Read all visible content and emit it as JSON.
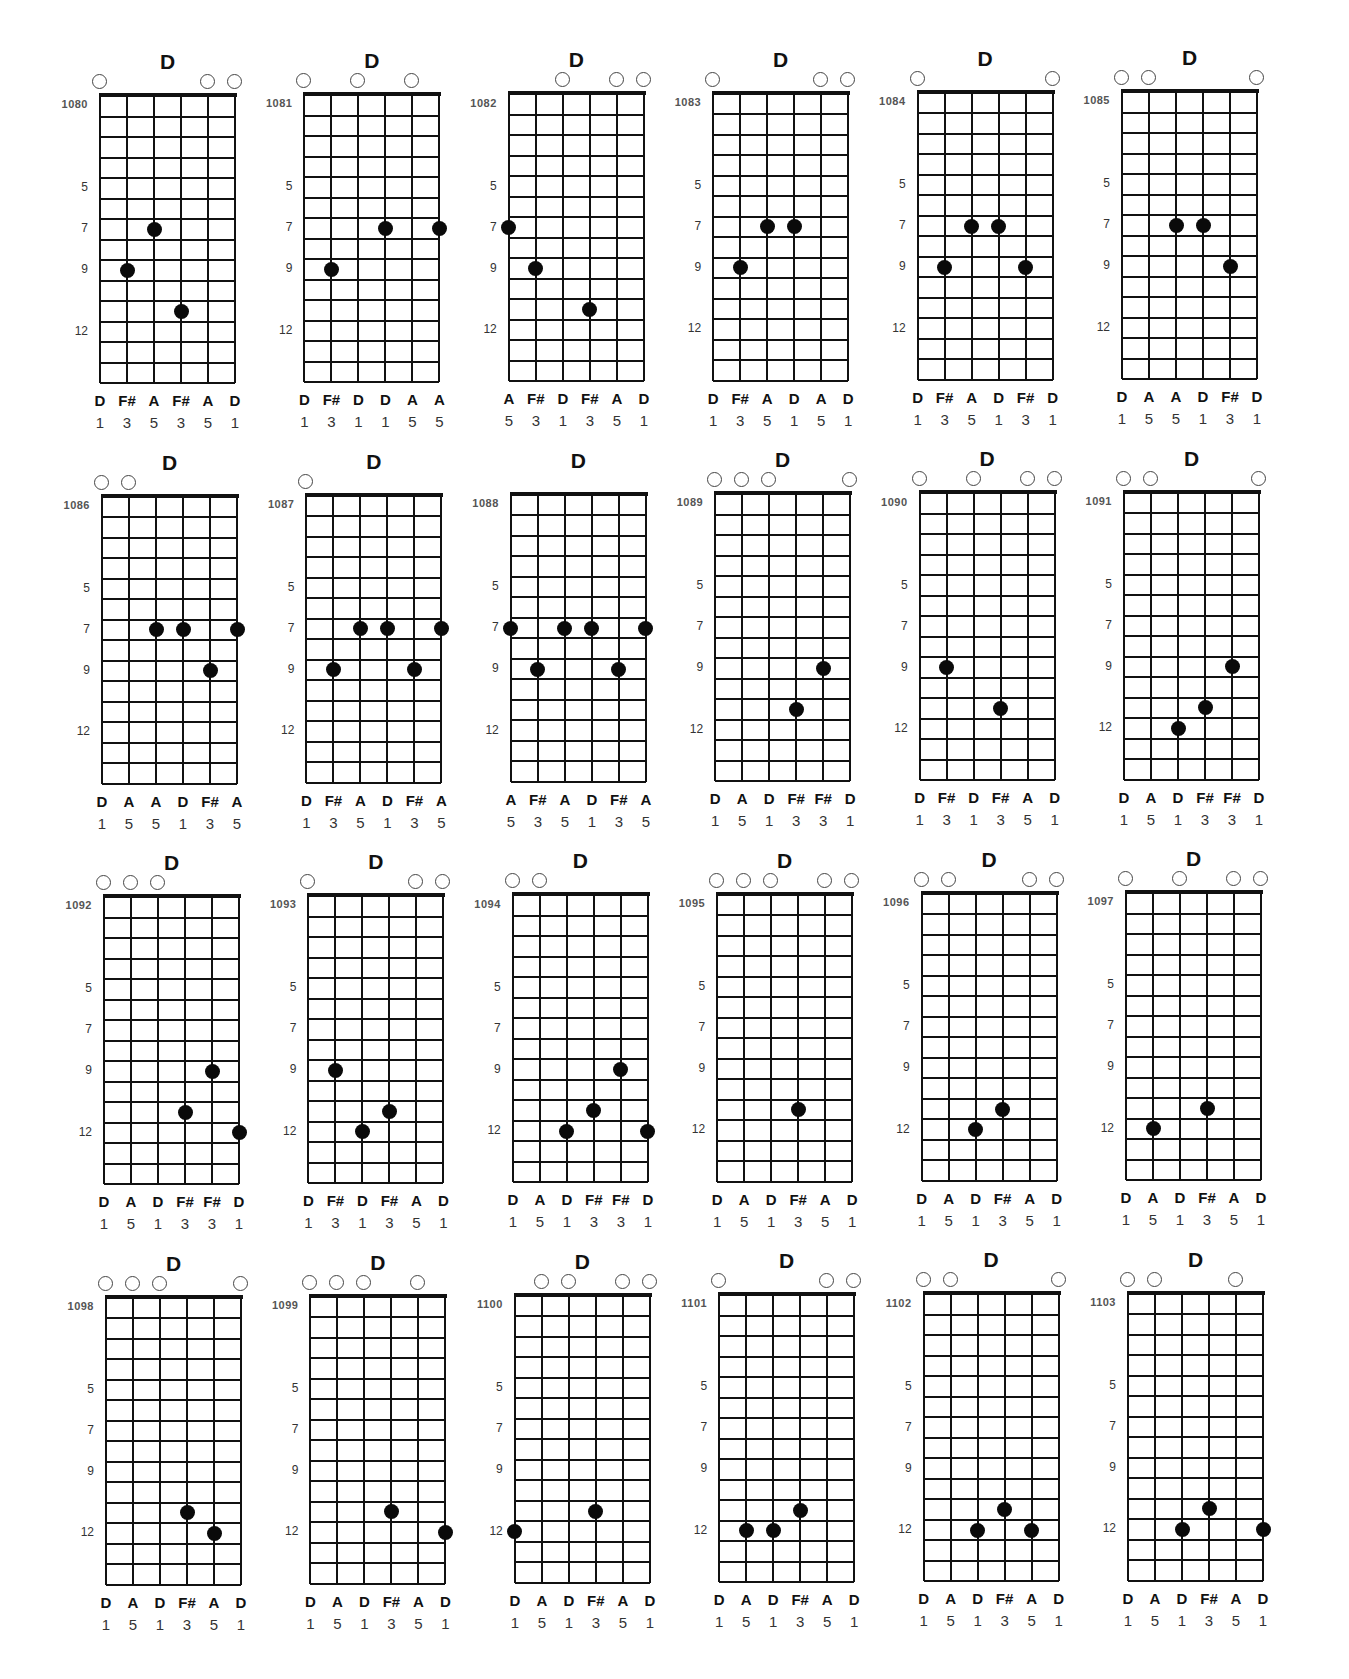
{
  "page": {
    "strings": 6,
    "frets_shown": 14,
    "fret_markers": [
      5,
      7,
      9,
      12
    ],
    "colors": {
      "ink": "#111111",
      "dot": "#0a0a0a",
      "background": "#ffffff"
    }
  },
  "charts": [
    {
      "id": "1080",
      "title": "D",
      "open": [
        0,
        4,
        5
      ],
      "dots": [
        [
          1,
          9
        ],
        [
          2,
          7
        ],
        [
          3,
          11
        ]
      ],
      "notes": [
        "D",
        "F#",
        "A",
        "F#",
        "A",
        "D"
      ],
      "fingers": [
        "1",
        "3",
        "5",
        "3",
        "5",
        "1"
      ]
    },
    {
      "id": "1081",
      "title": "D",
      "open": [
        0,
        2,
        4
      ],
      "dots": [
        [
          1,
          9
        ],
        [
          3,
          7
        ],
        [
          5,
          7
        ]
      ],
      "notes": [
        "D",
        "F#",
        "D",
        "D",
        "A",
        "A"
      ],
      "fingers": [
        "1",
        "3",
        "1",
        "1",
        "5",
        "5"
      ]
    },
    {
      "id": "1082",
      "title": "D",
      "open": [
        2,
        4,
        5
      ],
      "dots": [
        [
          0,
          7
        ],
        [
          1,
          9
        ],
        [
          3,
          11
        ]
      ],
      "notes": [
        "A",
        "F#",
        "D",
        "F#",
        "A",
        "D"
      ],
      "fingers": [
        "5",
        "3",
        "1",
        "3",
        "5",
        "1"
      ]
    },
    {
      "id": "1083",
      "title": "D",
      "open": [
        0,
        4,
        5
      ],
      "dots": [
        [
          1,
          9
        ],
        [
          2,
          7
        ],
        [
          3,
          7
        ]
      ],
      "notes": [
        "D",
        "F#",
        "A",
        "D",
        "A",
        "D"
      ],
      "fingers": [
        "1",
        "3",
        "5",
        "1",
        "5",
        "1"
      ]
    },
    {
      "id": "1084",
      "title": "D",
      "open": [
        0,
        5
      ],
      "dots": [
        [
          1,
          9
        ],
        [
          2,
          7
        ],
        [
          3,
          7
        ],
        [
          4,
          9
        ]
      ],
      "notes": [
        "D",
        "F#",
        "A",
        "D",
        "F#",
        "D"
      ],
      "fingers": [
        "1",
        "3",
        "5",
        "1",
        "3",
        "1"
      ]
    },
    {
      "id": "1085",
      "title": "D",
      "open": [
        0,
        1,
        5
      ],
      "dots": [
        [
          2,
          7
        ],
        [
          3,
          7
        ],
        [
          4,
          9
        ]
      ],
      "notes": [
        "D",
        "A",
        "A",
        "D",
        "F#",
        "D"
      ],
      "fingers": [
        "1",
        "5",
        "5",
        "1",
        "3",
        "1"
      ]
    },
    {
      "id": "1086",
      "title": "D",
      "open": [
        0,
        1
      ],
      "dots": [
        [
          2,
          7
        ],
        [
          3,
          7
        ],
        [
          4,
          9
        ],
        [
          5,
          7
        ]
      ],
      "notes": [
        "D",
        "A",
        "A",
        "D",
        "F#",
        "A"
      ],
      "fingers": [
        "1",
        "5",
        "5",
        "1",
        "3",
        "5"
      ]
    },
    {
      "id": "1087",
      "title": "D",
      "open": [
        0
      ],
      "dots": [
        [
          1,
          9
        ],
        [
          2,
          7
        ],
        [
          3,
          7
        ],
        [
          4,
          9
        ],
        [
          5,
          7
        ]
      ],
      "notes": [
        "D",
        "F#",
        "A",
        "D",
        "F#",
        "A"
      ],
      "fingers": [
        "1",
        "3",
        "5",
        "1",
        "3",
        "5"
      ]
    },
    {
      "id": "1088",
      "title": "D",
      "open": [],
      "dots": [
        [
          0,
          7
        ],
        [
          1,
          9
        ],
        [
          2,
          7
        ],
        [
          3,
          7
        ],
        [
          4,
          9
        ],
        [
          5,
          7
        ]
      ],
      "notes": [
        "A",
        "F#",
        "A",
        "D",
        "F#",
        "A"
      ],
      "fingers": [
        "5",
        "3",
        "5",
        "1",
        "3",
        "5"
      ]
    },
    {
      "id": "1089",
      "title": "D",
      "open": [
        0,
        1,
        2,
        5
      ],
      "dots": [
        [
          3,
          11
        ],
        [
          4,
          9
        ]
      ],
      "notes": [
        "D",
        "A",
        "D",
        "F#",
        "F#",
        "D"
      ],
      "fingers": [
        "1",
        "5",
        "1",
        "3",
        "3",
        "1"
      ]
    },
    {
      "id": "1090",
      "title": "D",
      "open": [
        0,
        2,
        4,
        5
      ],
      "dots": [
        [
          1,
          9
        ],
        [
          3,
          11
        ]
      ],
      "notes": [
        "D",
        "F#",
        "D",
        "F#",
        "A",
        "D"
      ],
      "fingers": [
        "1",
        "3",
        "1",
        "3",
        "5",
        "1"
      ]
    },
    {
      "id": "1091",
      "title": "D",
      "open": [
        0,
        1,
        5
      ],
      "dots": [
        [
          2,
          12
        ],
        [
          3,
          11
        ],
        [
          4,
          9
        ]
      ],
      "notes": [
        "D",
        "A",
        "D",
        "F#",
        "F#",
        "D"
      ],
      "fingers": [
        "1",
        "5",
        "1",
        "3",
        "3",
        "1"
      ]
    },
    {
      "id": "1092",
      "title": "D",
      "open": [
        0,
        1,
        2
      ],
      "dots": [
        [
          3,
          11
        ],
        [
          4,
          9
        ],
        [
          5,
          12
        ]
      ],
      "notes": [
        "D",
        "A",
        "D",
        "F#",
        "F#",
        "D"
      ],
      "fingers": [
        "1",
        "5",
        "1",
        "3",
        "3",
        "1"
      ]
    },
    {
      "id": "1093",
      "title": "D",
      "open": [
        0,
        4,
        5
      ],
      "dots": [
        [
          1,
          9
        ],
        [
          2,
          12
        ],
        [
          3,
          11
        ]
      ],
      "notes": [
        "D",
        "F#",
        "D",
        "F#",
        "A",
        "D"
      ],
      "fingers": [
        "1",
        "3",
        "1",
        "3",
        "5",
        "1"
      ]
    },
    {
      "id": "1094",
      "title": "D",
      "open": [
        0,
        1
      ],
      "dots": [
        [
          2,
          12
        ],
        [
          3,
          11
        ],
        [
          4,
          9
        ],
        [
          5,
          12
        ]
      ],
      "notes": [
        "D",
        "A",
        "D",
        "F#",
        "F#",
        "D"
      ],
      "fingers": [
        "1",
        "5",
        "1",
        "3",
        "3",
        "1"
      ]
    },
    {
      "id": "1095",
      "title": "D",
      "open": [
        0,
        1,
        2,
        4,
        5
      ],
      "dots": [
        [
          3,
          11
        ]
      ],
      "notes": [
        "D",
        "A",
        "D",
        "F#",
        "A",
        "D"
      ],
      "fingers": [
        "1",
        "5",
        "1",
        "3",
        "5",
        "1"
      ]
    },
    {
      "id": "1096",
      "title": "D",
      "open": [
        0,
        1,
        4,
        5
      ],
      "dots": [
        [
          2,
          12
        ],
        [
          3,
          11
        ]
      ],
      "notes": [
        "D",
        "A",
        "D",
        "F#",
        "A",
        "D"
      ],
      "fingers": [
        "1",
        "5",
        "1",
        "3",
        "5",
        "1"
      ]
    },
    {
      "id": "1097",
      "title": "D",
      "open": [
        0,
        2,
        4,
        5
      ],
      "dots": [
        [
          1,
          12
        ],
        [
          3,
          11
        ]
      ],
      "notes": [
        "D",
        "A",
        "D",
        "F#",
        "A",
        "D"
      ],
      "fingers": [
        "1",
        "5",
        "1",
        "3",
        "5",
        "1"
      ]
    },
    {
      "id": "1098",
      "title": "D",
      "open": [
        0,
        1,
        2,
        5
      ],
      "dots": [
        [
          3,
          11
        ],
        [
          4,
          12
        ]
      ],
      "notes": [
        "D",
        "A",
        "D",
        "F#",
        "A",
        "D"
      ],
      "fingers": [
        "1",
        "5",
        "1",
        "3",
        "5",
        "1"
      ]
    },
    {
      "id": "1099",
      "title": "D",
      "open": [
        0,
        1,
        2,
        4
      ],
      "dots": [
        [
          3,
          11
        ],
        [
          5,
          12
        ]
      ],
      "notes": [
        "D",
        "A",
        "D",
        "F#",
        "A",
        "D"
      ],
      "fingers": [
        "1",
        "5",
        "1",
        "3",
        "5",
        "1"
      ]
    },
    {
      "id": "1100",
      "title": "D",
      "open": [
        1,
        2,
        4,
        5
      ],
      "dots": [
        [
          0,
          12
        ],
        [
          3,
          11
        ]
      ],
      "notes": [
        "D",
        "A",
        "D",
        "F#",
        "A",
        "D"
      ],
      "fingers": [
        "1",
        "5",
        "1",
        "3",
        "5",
        "1"
      ]
    },
    {
      "id": "1101",
      "title": "D",
      "open": [
        0,
        4,
        5
      ],
      "dots": [
        [
          1,
          12
        ],
        [
          2,
          12
        ],
        [
          3,
          11
        ]
      ],
      "notes": [
        "D",
        "A",
        "D",
        "F#",
        "A",
        "D"
      ],
      "fingers": [
        "1",
        "5",
        "1",
        "3",
        "5",
        "1"
      ]
    },
    {
      "id": "1102",
      "title": "D",
      "open": [
        0,
        1,
        5
      ],
      "dots": [
        [
          2,
          12
        ],
        [
          3,
          11
        ],
        [
          4,
          12
        ]
      ],
      "notes": [
        "D",
        "A",
        "D",
        "F#",
        "A",
        "D"
      ],
      "fingers": [
        "1",
        "5",
        "1",
        "3",
        "5",
        "1"
      ]
    },
    {
      "id": "1103",
      "title": "D",
      "open": [
        0,
        1,
        4
      ],
      "dots": [
        [
          2,
          12
        ],
        [
          3,
          11
        ],
        [
          5,
          12
        ]
      ],
      "notes": [
        "D",
        "A",
        "D",
        "F#",
        "A",
        "D"
      ],
      "fingers": [
        "1",
        "5",
        "1",
        "3",
        "5",
        "1"
      ]
    }
  ]
}
